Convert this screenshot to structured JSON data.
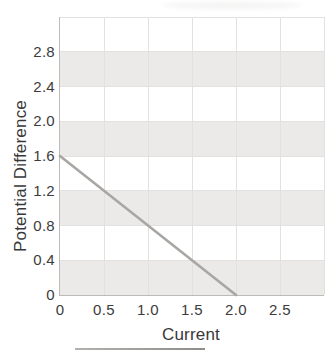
{
  "chart_data": {
    "type": "line",
    "xlabel": "Current",
    "ylabel": "Potential Difference",
    "xlim": [
      0,
      3.0
    ],
    "ylim": [
      0,
      3.2
    ],
    "x_tick_values": [
      0,
      0.5,
      1.0,
      1.5,
      2.0,
      2.5
    ],
    "x_tick_labels": [
      "0",
      "0.5",
      "1.0",
      "1.5",
      "2.0",
      "2.5"
    ],
    "y_tick_values": [
      0,
      0.4,
      0.8,
      1.2,
      1.6,
      2.0,
      2.4,
      2.8
    ],
    "y_tick_labels": [
      "0",
      "0.4",
      "0.8",
      "1.2",
      "1.6",
      "2.0",
      "2.4",
      "2.8"
    ],
    "x_gridline_values": [
      0.5,
      1.0,
      1.5,
      2.0,
      2.5,
      3.0
    ],
    "y_gridline_values": [
      0.4,
      0.8,
      1.2,
      1.6,
      2.0,
      2.4,
      2.8,
      3.2
    ],
    "shaded_bands": [
      [
        0,
        0.4
      ],
      [
        0.8,
        1.2
      ],
      [
        1.6,
        2.0
      ],
      [
        2.4,
        2.8
      ]
    ],
    "grid": "on",
    "legend_position": "none",
    "series": [
      {
        "name": "Potential Difference vs Current",
        "points": [
          [
            0,
            1.6
          ],
          [
            2.0,
            0
          ]
        ],
        "color": "#a9a7a4",
        "markers": false
      }
    ],
    "y_intercept": 1.6,
    "x_intercept": 2.0,
    "slope": -0.8
  },
  "colors": {
    "background": "#ffffff",
    "band_fill": "#ebeae8",
    "gridline": "#e3e1df",
    "axis_line": "#bdbbb8",
    "tick_text": "#3c3c3c",
    "title_text": "#383838",
    "series_line": "#a9a7a4",
    "cropped_border": "#9c9a98"
  }
}
